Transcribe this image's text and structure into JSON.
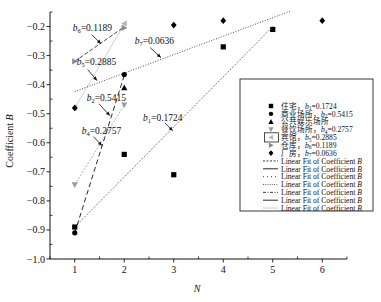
{
  "chart_data": {
    "type": "scatter",
    "title": "",
    "xlabel": "N",
    "ylabel": "Coefficient ",
    "ylabel_italic": "B",
    "xlim": [
      0.5,
      6.5
    ],
    "ylim": [
      -1.0,
      -0.15
    ],
    "grid": false,
    "legend_position": "inside-right",
    "xticks": [
      1,
      2,
      3,
      4,
      5,
      6
    ],
    "xtick_labels": [
      "1",
      "2",
      "3",
      "4",
      "5",
      "6"
    ],
    "yticks": [
      -0.2,
      -0.3,
      -0.4,
      -0.5,
      -0.6,
      -0.7,
      -0.8,
      -0.9,
      -1.0
    ],
    "ytick_labels": [
      "−0.2",
      "−0.3",
      "−0.4",
      "−0.5",
      "−0.6",
      "−0.7",
      "−0.8",
      "−0.9",
      "−1.0"
    ],
    "series": [
      {
        "name": "住宅",
        "b_sub": "1",
        "b_value": "0.1724",
        "marker": "square",
        "color": "#000000",
        "x": [
          1,
          2,
          3,
          4,
          5
        ],
        "y": [
          -0.89,
          -0.64,
          -0.71,
          -0.27,
          -0.21
        ],
        "fit": {
          "slope": 0.1724,
          "intercept": -1.0624,
          "x_range": [
            1,
            5
          ],
          "color": "#222222",
          "dash": "1,1.4",
          "width": 0.8
        }
      },
      {
        "name": "商业场所",
        "b_sub": "2",
        "b_value": "0.5415",
        "marker": "circle",
        "color": "#000000",
        "x": [
          1,
          2
        ],
        "y": [
          -0.91,
          -0.365
        ],
        "fit": {
          "slope": 0.5415,
          "intercept": -1.4515,
          "x_range": [
            1,
            2.02
          ],
          "color": "#111111",
          "dash": "5,3",
          "width": 0.9
        }
      },
      {
        "name": "公共娱乐场所",
        "b_sub": "",
        "b_value": "",
        "marker": "triangle-up",
        "color": "#000000",
        "x": [
          2
        ],
        "y": [
          -0.41
        ],
        "fit": null
      },
      {
        "name": "餐饮场所",
        "b_sub": "4",
        "b_value": "0.2757",
        "marker": "triangle-down",
        "color": "#9a9a9a",
        "x": [
          1,
          2
        ],
        "y": [
          -0.745,
          -0.47
        ],
        "fit": {
          "slope": 0.2757,
          "intercept": -1.0207,
          "x_range": [
            1,
            2
          ],
          "color": "#a8a8a8",
          "dash": "2,1.5",
          "width": 0.9
        }
      },
      {
        "name": "宾馆",
        "b_sub": "5",
        "b_value": "0.2885",
        "marker": "triangle-left",
        "color": "#b5b5b5",
        "x": [
          1,
          2
        ],
        "y": [
          -0.48,
          -0.19
        ],
        "fit": {
          "slope": 0.2885,
          "intercept": -0.7685,
          "x_range": [
            1,
            2
          ],
          "color": "#c4c4c4",
          "dash": "",
          "width": 0.8
        }
      },
      {
        "name": "仓库",
        "b_sub": "6",
        "b_value": "0.1189",
        "marker": "triangle-right",
        "color": "#8c8c8c",
        "x": [
          1,
          2
        ],
        "y": [
          -0.32,
          -0.205
        ],
        "fit": {
          "slope": 0.1189,
          "intercept": -0.4389,
          "x_range": [
            1,
            2
          ],
          "color": "#333333",
          "dash": "4,2",
          "width": 0.9
        }
      },
      {
        "name": "厂房",
        "b_sub": "7",
        "b_value": "0.0636",
        "marker": "diamond",
        "color": "#000000",
        "x": [
          1,
          3,
          4,
          6
        ],
        "y": [
          -0.48,
          -0.195,
          -0.18,
          -0.18
        ],
        "fit": {
          "slope": 0.0636,
          "intercept": -0.4876,
          "x_range": [
            1,
            5.35
          ],
          "color": "#222222",
          "dash": "1,1.6",
          "width": 0.8
        }
      }
    ],
    "annotations": [
      {
        "b": "b",
        "sub": "6",
        "value": "=0.1189",
        "text_at": [
          0.96,
          -0.214
        ],
        "arrow_from": [
          1.34,
          -0.228
        ],
        "arrow_to": [
          1.53,
          -0.259
        ]
      },
      {
        "b": "b",
        "sub": "5",
        "value": "=0.2885",
        "text_at": [
          1.04,
          -0.334
        ],
        "arrow_from": [
          1.26,
          -0.348
        ],
        "arrow_to": [
          1.45,
          -0.386
        ]
      },
      {
        "b": "b",
        "sub": "7",
        "value": "=0.0636",
        "text_at": [
          2.21,
          -0.259
        ],
        "arrow_from": [
          2.52,
          -0.272
        ],
        "arrow_to": [
          2.74,
          -0.307
        ]
      },
      {
        "b": "b",
        "sub": "2",
        "value": "=0.5415",
        "text_at": [
          1.24,
          -0.455
        ],
        "arrow_from": [
          1.49,
          -0.466
        ],
        "arrow_to": [
          1.71,
          -0.507
        ]
      },
      {
        "b": "b",
        "sub": "4",
        "value": "=0.2757",
        "text_at": [
          1.14,
          -0.569
        ],
        "arrow_from": [
          1.38,
          -0.579
        ],
        "arrow_to": [
          1.55,
          -0.61
        ]
      },
      {
        "b": "b",
        "sub": "1",
        "value": "=0.1724",
        "text_at": [
          2.38,
          -0.524
        ],
        "arrow_from": [
          2.82,
          -0.531
        ],
        "arrow_to": [
          2.98,
          -0.559
        ]
      }
    ],
    "legend": {
      "separator": "，",
      "fit_label": "Linear Fit of Coefficient ",
      "fit_label_italic": "B",
      "fit_lines": [
        {
          "color": "#222222",
          "dash": "2,1.5"
        },
        {
          "color": "#111111",
          "dash": ""
        },
        {
          "color": "#333333",
          "dash": "1,3"
        },
        {
          "color": "#555555",
          "dash": "1,1.2"
        },
        {
          "color": "#222222",
          "dash": "3,1.5,1,1.5"
        },
        {
          "color": "#111111",
          "dash": ""
        },
        {
          "color": "#c8c8c8",
          "dash": ""
        }
      ],
      "highlighted_entry": 4
    }
  }
}
